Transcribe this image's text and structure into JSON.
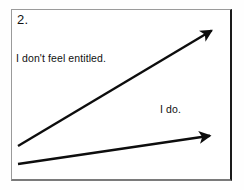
{
  "panel": {
    "number_label": "2.",
    "border_color": "#9a9a9a",
    "shadow_color": "#1a1a1a",
    "background": "#ffffff"
  },
  "annotations": [
    {
      "id": "upper",
      "text": "I don't feel entitled."
    },
    {
      "id": "lower",
      "text": "I do."
    }
  ],
  "chart_data": {
    "type": "line",
    "title": "2.",
    "xlabel": "",
    "ylabel": "",
    "grid": false,
    "legend": "none",
    "arrow_color": "#0d0d0d",
    "series": [
      {
        "name": "I don't feel entitled.",
        "slope": "steep",
        "x": [
          18,
          216
        ],
        "y": [
          146,
          28
        ],
        "arrowhead": "end",
        "stroke_width": 2.4
      },
      {
        "name": "I do.",
        "slope": "shallow",
        "x": [
          18,
          215
        ],
        "y": [
          164,
          135
        ],
        "arrowhead": "end",
        "stroke_width": 2.4
      }
    ]
  }
}
